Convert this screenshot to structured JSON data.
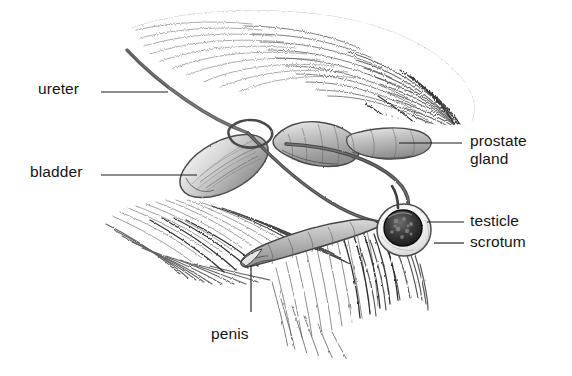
{
  "figure": {
    "medium": "graphite pencil drawing",
    "background_color": "#ffffff",
    "ink_color": "#141414",
    "width": 572,
    "height": 376
  },
  "labels": {
    "ureter": "ureter",
    "bladder": "bladder",
    "prostate_line1": "prostate",
    "prostate_line2": "gland",
    "testicle": "testicle",
    "scrotum": "scrotum",
    "penis": "penis"
  },
  "label_positions": {
    "ureter": {
      "x": 38,
      "y": 80,
      "align": "left"
    },
    "bladder": {
      "x": 30,
      "y": 163,
      "align": "left"
    },
    "prostate": {
      "x": 470,
      "y": 132,
      "align": "left"
    },
    "testicle": {
      "x": 470,
      "y": 212,
      "align": "left"
    },
    "scrotum": {
      "x": 470,
      "y": 233,
      "align": "left"
    },
    "penis": {
      "x": 211,
      "y": 325,
      "align": "left"
    }
  },
  "leader_lines": [
    {
      "name": "ureter-leader",
      "x1": 101,
      "y1": 92,
      "x2": 168,
      "y2": 92
    },
    {
      "name": "bladder-leader",
      "x1": 101,
      "y1": 175,
      "x2": 197,
      "y2": 175
    },
    {
      "name": "prostate-leader",
      "x1": 399,
      "y1": 143,
      "x2": 462,
      "y2": 143
    },
    {
      "name": "testicle-leader",
      "x1": 427,
      "y1": 222,
      "x2": 464,
      "y2": 222
    },
    {
      "name": "scrotum-leader",
      "x1": 434,
      "y1": 243,
      "x2": 464,
      "y2": 243
    },
    {
      "name": "penis-leader",
      "x1": 251,
      "y1": 266,
      "x2": 251,
      "y2": 312
    }
  ],
  "structures": [
    {
      "name": "ureter",
      "description": "thin curved tube descending from upper left to bladder neck"
    },
    {
      "name": "bladder",
      "description": "elongated oval sac angled down-left"
    },
    {
      "name": "prostate-gland",
      "description": "bulbous segmented gland right of bladder neck"
    },
    {
      "name": "ductus-deferens",
      "description": "long looping duct from prostate region down to testicle"
    },
    {
      "name": "penis",
      "description": "tapering segmented tube extending down-left"
    },
    {
      "name": "testicle",
      "description": "dark round stippled mass"
    },
    {
      "name": "scrotum",
      "description": "pale sac surrounding the testicle"
    },
    {
      "name": "body-rump-fur",
      "description": "hatched fur mass across the upper right"
    },
    {
      "name": "thigh-fur",
      "description": "hatched fur wedge at lower left"
    },
    {
      "name": "hind-limb-fur",
      "description": "hatched fur mass at lower right"
    }
  ]
}
